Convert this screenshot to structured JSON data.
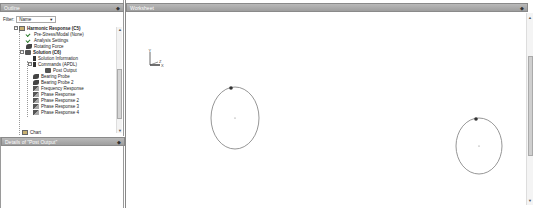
{
  "outline": {
    "title": "Outline",
    "pin_icon": "pin-icon",
    "filter_label": "Filter:",
    "filter_value": "Name",
    "tree": [
      {
        "label": "Harmonic Response (C5)",
        "bold": true,
        "level": 0,
        "icon": "harmonic-analysis-icon",
        "expander": "−"
      },
      {
        "label": "Pre-Stress/Modal (None)",
        "level": 1,
        "icon": "check-icon"
      },
      {
        "label": "Analysis Settings",
        "level": 1,
        "icon": "analysis-settings-icon"
      },
      {
        "label": "Rotating Force",
        "level": 1,
        "icon": "rotating-force-icon"
      },
      {
        "label": "Solution (C6)",
        "bold": true,
        "level": 1,
        "icon": "solution-icon",
        "expander": "−"
      },
      {
        "label": "Solution Information",
        "level": 2,
        "icon": "solution-information-icon"
      },
      {
        "label": "Commands (APDL)",
        "level": 2,
        "icon": "commands-icon",
        "expander": "−"
      },
      {
        "label": "Post Output",
        "level": 3,
        "icon": "post-output-icon"
      },
      {
        "label": "Bearing Probe",
        "level": 2,
        "icon": "bearing-probe-icon"
      },
      {
        "label": "Bearing Probe 2",
        "level": 2,
        "icon": "bearing-probe-icon"
      },
      {
        "label": "Frequency Response",
        "level": 2,
        "icon": "frequency-response-icon"
      },
      {
        "label": "Phase Response",
        "level": 2,
        "icon": "phase-response-icon"
      },
      {
        "label": "Phase Response 2",
        "level": 2,
        "icon": "phase-response-icon"
      },
      {
        "label": "Phase Response 3",
        "level": 2,
        "icon": "phase-response-icon"
      },
      {
        "label": "Phase Response 4",
        "level": 2,
        "icon": "phase-response-icon"
      },
      {
        "label": "Chart",
        "level": 0,
        "icon": "chart-icon"
      }
    ]
  },
  "details": {
    "title": "Details of \"Post Output\""
  },
  "worksheet": {
    "title": "Worksheet",
    "triad": {
      "y_label": "Y",
      "z_label": "Z",
      "x_label": "X"
    },
    "orbits": [
      {
        "cx": 109,
        "cy": 118,
        "rx": 24,
        "ry": 31,
        "marker_x": 105,
        "marker_y": 88
      },
      {
        "cx": 353,
        "cy": 146,
        "rx": 23,
        "ry": 28,
        "marker_x": 350,
        "marker_y": 124
      }
    ],
    "line_color": "#8a8a8a",
    "marker_color": "#333333"
  }
}
